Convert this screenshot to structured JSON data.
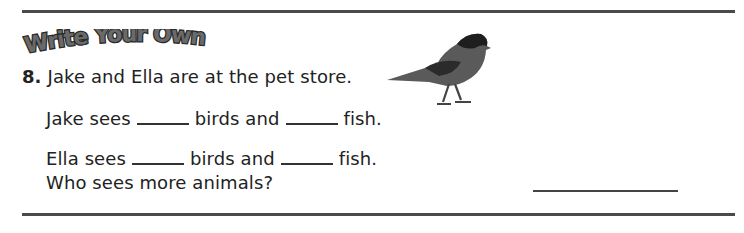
{
  "banner": {
    "label": "Write Your Own"
  },
  "question": {
    "number": "8.",
    "prompt": "Jake and Ella are at the pet store.",
    "line1": {
      "who": "Jake sees",
      "mid": "birds and",
      "end": "fish."
    },
    "line2": {
      "who": "Ella sees",
      "mid": "birds and",
      "end": "fish."
    },
    "ask": "Who sees more animals?"
  },
  "image": {
    "icon": "bird-icon"
  }
}
